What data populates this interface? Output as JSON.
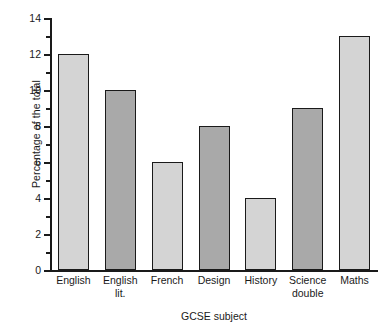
{
  "chart_data": {
    "type": "bar",
    "title": "",
    "xlabel": "GCSE subject",
    "ylabel": "Percentage of the total",
    "categories": [
      "English",
      "English lit.",
      "French",
      "Design",
      "History",
      "Science double",
      "Maths"
    ],
    "category_lines": [
      [
        "English"
      ],
      [
        "English",
        "lit."
      ],
      [
        "French"
      ],
      [
        "Design"
      ],
      [
        "History"
      ],
      [
        "Science",
        "double"
      ],
      [
        "Maths"
      ]
    ],
    "values": [
      12,
      10,
      6,
      8,
      4,
      9,
      13
    ],
    "ylim": [
      0,
      14
    ],
    "ytick_major": [
      0,
      2,
      4,
      6,
      8,
      10,
      12,
      14
    ],
    "ytick_minor": [
      1,
      3,
      5,
      7,
      9,
      11,
      13
    ],
    "ytick_labels": [
      "0",
      "2",
      "4",
      "6",
      "8",
      "10",
      "12",
      "14"
    ],
    "grid": false,
    "legend": "none",
    "bar_colors": [
      "#d4d4d4",
      "#a9a9a9",
      "#d4d4d4",
      "#a9a9a9",
      "#d4d4d4",
      "#a9a9a9",
      "#d4d4d4"
    ],
    "bar_edge_color": "#1a1a1a",
    "axis_color": "#1a1a1a",
    "background": "#ffffff"
  }
}
